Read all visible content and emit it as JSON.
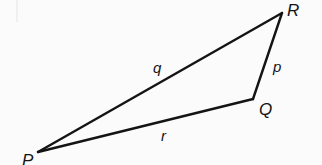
{
  "figure": {
    "kind": "geometry-diagram",
    "shape": "triangle",
    "background_color": "#fbfbfb",
    "stroke_color": "#141414",
    "stroke_width": 2.4,
    "vertices": [
      {
        "id": "P",
        "label": "P",
        "x": 38,
        "y": 152,
        "label_x": 22,
        "label_y": 152,
        "clipped": true
      },
      {
        "id": "Q",
        "label": "Q",
        "x": 253,
        "y": 99,
        "label_x": 259,
        "label_y": 101,
        "clipped": false
      },
      {
        "id": "R",
        "label": "R",
        "x": 282,
        "y": 13,
        "label_x": 287,
        "label_y": 2,
        "clipped": false
      }
    ],
    "sides": [
      {
        "id": "p",
        "label": "p",
        "from": "Q",
        "to": "R",
        "label_x": 273,
        "label_y": 59
      },
      {
        "id": "q",
        "label": "q",
        "from": "P",
        "to": "R",
        "label_x": 153,
        "label_y": 60
      },
      {
        "id": "r",
        "label": "r",
        "from": "P",
        "to": "Q",
        "label_x": 161,
        "label_y": 128
      }
    ]
  }
}
